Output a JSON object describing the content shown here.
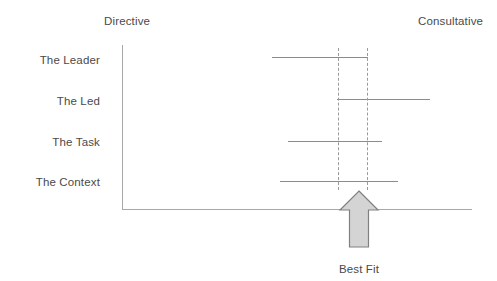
{
  "diagram": {
    "title_left": "Directive",
    "title_right": "Consultative",
    "caption": "Best Fit",
    "rows": [
      {
        "label": "The Leader",
        "bar_start": 272,
        "bar_end": 368,
        "y": 57
      },
      {
        "label": "The Led",
        "bar_start": 337,
        "bar_end": 430,
        "y": 99
      },
      {
        "label": "The Task",
        "bar_start": 288,
        "bar_end": 382,
        "y": 141
      },
      {
        "label": "The Context",
        "bar_start": 280,
        "bar_end": 398,
        "y": 181
      }
    ],
    "guides": {
      "left_x": 338,
      "right_x": 367
    },
    "colors": {
      "axis": "#a8a8a8",
      "bar": "#8c8c8c",
      "guide": "#9a9a9a",
      "arrow_fill": "#d4d4d4",
      "arrow_stroke": "#808080",
      "text": "#4a4a4a",
      "background": "#ffffff"
    },
    "icons": {
      "arrow": "arrow-up-icon"
    }
  }
}
